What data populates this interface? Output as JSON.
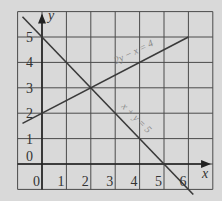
{
  "chart_data": {
    "type": "line",
    "title": "",
    "xlabel": "x",
    "ylabel": "y",
    "xlim": [
      -1,
      7
    ],
    "ylim": [
      -1,
      6
    ],
    "grid": true,
    "x_ticks": [
      "0",
      "1",
      "2",
      "3",
      "4",
      "5",
      "6"
    ],
    "y_ticks": [
      "0",
      "1",
      "2",
      "3",
      "4",
      "5"
    ],
    "series": [
      {
        "name": "2y − x = 4",
        "equation": "2y - x = 4",
        "x": [
          -0.8,
          0,
          2,
          6
        ],
        "y": [
          1.6,
          2,
          3,
          5
        ]
      },
      {
        "name": "x + y = 5",
        "equation": "x + y = 5",
        "x": [
          -0.8,
          0,
          2,
          5,
          6.2
        ],
        "y": [
          5.8,
          5,
          3,
          0,
          -1.2
        ]
      }
    ],
    "annotations": [
      {
        "text": "2y − x = 4",
        "near": [
          3,
          3.6
        ]
      },
      {
        "text": "x + y = 5",
        "near": [
          3.6,
          1.5
        ]
      },
      {
        "text": "intersection",
        "point": [
          2,
          3
        ]
      }
    ]
  },
  "labels": {
    "x_axis": "x",
    "y_axis": "y",
    "eq1": "2y − x = 4",
    "eq2": "x + y = 5"
  },
  "colors": {
    "background": "#d9d9d9",
    "grid": "#444444",
    "line": "#3a3a3a",
    "label": "#888888"
  }
}
